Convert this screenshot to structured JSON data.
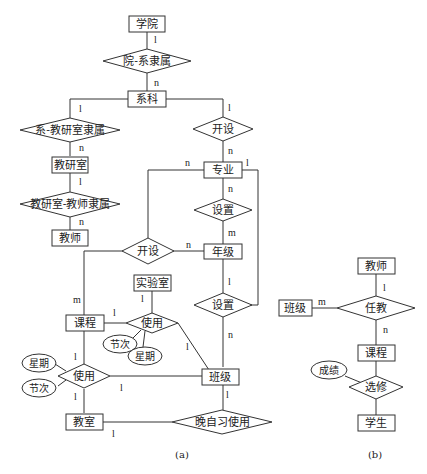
{
  "diagram_a": {
    "caption": "(a)",
    "entities": {
      "xueyuan": "学院",
      "xike": "系科",
      "jiaoyanshi": "教研室",
      "jiaoshi": "教师",
      "zhuanye": "专业",
      "nianji": "年级",
      "shiyanshi": "实验室",
      "kecheng": "课程",
      "banji": "班级",
      "jiaoshi_room": "教室"
    },
    "relationships": {
      "yuan_xi": "院-系隶属",
      "xi_jys": "系-教研室隶属",
      "jys_js": "教研室-教师隶属",
      "kaishe_top": "开设",
      "shezhi_top": "设置",
      "kaishe_mid": "开设",
      "shezhi_bottom": "设置",
      "shiyong_lab": "使用",
      "shiyong_room": "使用",
      "wanzixi": "晚自习使用"
    },
    "attributes": {
      "jieci_lab": "节次",
      "xingqi_lab": "星期",
      "xingqi_room": "星期",
      "jieci_room": "节次"
    },
    "cardinalities": {
      "xueyuan_1": "l",
      "xike_n": "n",
      "xike_1_left": "l",
      "jys_n": "n",
      "jys_1": "l",
      "js_n": "n",
      "xike_1_right": "l",
      "zhuanye_n_top": "n",
      "zhuanye_n_left": "n",
      "zhuanye_1_right": "l",
      "zhuanye_n_down": "n",
      "nianji_m": "m",
      "nianji_n": "n",
      "nianji_1": "l",
      "banji_n": "n",
      "kecheng_m": "m",
      "shiyanshi_1": "l",
      "kecheng_1_lab": "l",
      "banji_1_lab": "l",
      "kecheng_1_room": "l",
      "banji_1_room": "l",
      "jiaoshi_1_room": "l",
      "banji_1_wzx": "l",
      "jiaoshi_1_wzx": "l"
    }
  },
  "diagram_b": {
    "caption": "(b)",
    "entities": {
      "jiaoshi": "教师",
      "banji": "班级",
      "kecheng": "课程",
      "xuesheng": "学生"
    },
    "relationships": {
      "renjiao": "任教",
      "xuanxiu": "选修"
    },
    "attributes": {
      "chengji": "成绩"
    },
    "cardinalities": {
      "jiaoshi_1": "l",
      "banji_m": "m",
      "kecheng_n": "n"
    }
  }
}
